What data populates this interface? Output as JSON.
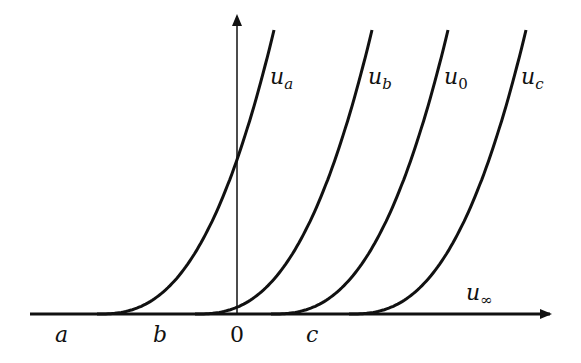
{
  "figure": {
    "curves": [
      {
        "name": "u_a",
        "main": "u",
        "sub": "a",
        "start_x": 97,
        "shift": 0
      },
      {
        "name": "u_b",
        "main": "u",
        "sub": "b",
        "start_x": 195,
        "shift": 98
      },
      {
        "name": "u_0",
        "main": "u",
        "sub": "0",
        "start_x": 271,
        "shift": 174
      },
      {
        "name": "u_c",
        "main": "u",
        "sub": "c",
        "start_x": 349,
        "shift": 252
      }
    ],
    "axis_labels": {
      "a": "a",
      "b": "b",
      "zero": "0",
      "c": "c",
      "u_inf_main": "u",
      "u_inf_sub": "∞"
    },
    "colors": {
      "stroke": "#111111",
      "background": "#ffffff"
    }
  }
}
